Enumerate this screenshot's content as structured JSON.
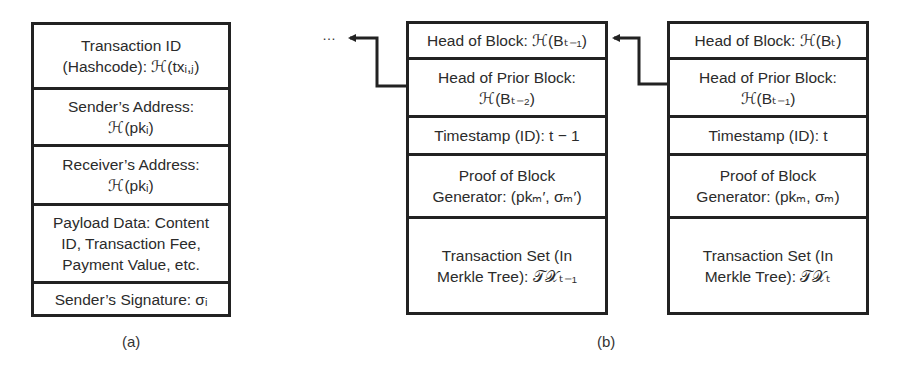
{
  "figure": {
    "panel_a": {
      "caption": "(a)",
      "title": "Transaction structure",
      "rows": [
        {
          "lines": [
            "Transaction ID",
            "(Hashcode): ℋ(txᵢ,ⱼ)"
          ]
        },
        {
          "lines": [
            "Sender’s Address:",
            "ℋ(pkᵢ)"
          ]
        },
        {
          "lines": [
            "Receiver’s Address:",
            "ℋ(pkᵢ)"
          ]
        },
        {
          "lines": [
            "Payload Data: Content",
            "ID, Transaction Fee,",
            "Payment Value, etc."
          ]
        },
        {
          "lines": [
            "Sender’s Signature: σᵢ"
          ]
        }
      ]
    },
    "panel_b": {
      "caption": "(b)",
      "ellipsis": "…",
      "blocks": [
        {
          "name": "block-t-minus-1",
          "rows": [
            {
              "lines": [
                "Head of Block: ℋ(Bₜ₋₁)"
              ]
            },
            {
              "lines": [
                "Head of Prior Block:",
                "ℋ(Bₜ₋₂)"
              ]
            },
            {
              "lines": [
                "Timestamp (ID): t − 1"
              ]
            },
            {
              "lines": [
                "Proof of Block",
                "Generator: (pkₘ′, σₘ′)"
              ]
            },
            {
              "lines": [
                "Transaction Set (In",
                "Merkle Tree): 𝒯𝒳ₜ₋₁"
              ]
            }
          ]
        },
        {
          "name": "block-t",
          "rows": [
            {
              "lines": [
                "Head of Block: ℋ(Bₜ)"
              ]
            },
            {
              "lines": [
                "Head of Prior Block:",
                "ℋ(Bₜ₋₁)"
              ]
            },
            {
              "lines": [
                "Timestamp (ID): t"
              ]
            },
            {
              "lines": [
                "Proof of Block",
                "Generator: (pkₘ, σₘ)"
              ]
            },
            {
              "lines": [
                "Transaction Set (In",
                "Merkle Tree): 𝒯𝒳ₜ"
              ]
            }
          ]
        }
      ]
    },
    "colors": {
      "stroke": "#222222",
      "text": "#2b2b2b",
      "background": "#ffffff"
    }
  }
}
